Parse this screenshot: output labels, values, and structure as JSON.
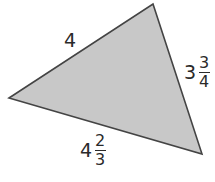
{
  "figure": {
    "shape": "triangle",
    "fill": "#c8c8c8",
    "stroke": "#444444",
    "vertices": [
      [
        9,
        98
      ],
      [
        153,
        4
      ],
      [
        202,
        154
      ]
    ]
  },
  "labels": {
    "top_left_side": {
      "text": "4"
    },
    "right_side": {
      "whole": "3",
      "numerator": "3",
      "denominator": "4"
    },
    "bottom_side": {
      "whole": "4",
      "numerator": "2",
      "denominator": "3"
    }
  }
}
